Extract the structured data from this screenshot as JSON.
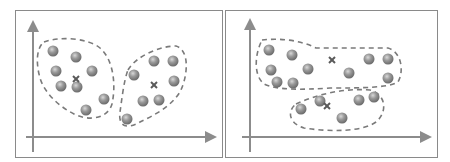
{
  "colors": {
    "frame": "#8a8a8a",
    "axis": "#8c8c8c",
    "dash": "#7a7a7a",
    "point_light": "#d0d0d0",
    "point_mid": "#9a9a9a",
    "point_dark": "#6e6e6e",
    "centroid": "#5a5a5a"
  },
  "panels": [
    {
      "name": "left-panel",
      "frame": {
        "x": 15,
        "y": 10,
        "w": 207,
        "h": 147
      },
      "y_axis": {
        "x": 33,
        "y1": 152,
        "y2": 26
      },
      "x_axis": {
        "y": 137,
        "x1": 26,
        "x2": 211
      },
      "clusters": [
        {
          "name": "cluster-1",
          "outline": "M 44 42 C 60 36, 88 38, 100 48 C 114 60, 116 86, 112 104 C 108 118, 90 122, 74 114 C 58 106, 44 92, 40 78 C 36 64, 36 48, 44 42 Z",
          "points": [
            [
              53,
              51
            ],
            [
              76,
              57
            ],
            [
              56,
              71
            ],
            [
              92,
              71
            ],
            [
              61,
              86
            ],
            [
              77,
              87
            ],
            [
              104,
              99
            ],
            [
              86,
              110
            ]
          ],
          "centroid": [
            76,
            79
          ]
        },
        {
          "name": "cluster-2",
          "outline": "M 128 70 C 136 56, 160 46, 176 46 C 190 50, 188 76, 180 92 C 170 108, 152 116, 140 122 C 126 130, 118 126, 120 112 C 122 98, 124 80, 128 70 Z",
          "points": [
            [
              154,
              61
            ],
            [
              173,
              61
            ],
            [
              134,
              75
            ],
            [
              174,
              81
            ],
            [
              143,
              101
            ],
            [
              159,
              100
            ],
            [
              127,
              119
            ]
          ],
          "centroid": [
            154,
            85
          ]
        }
      ]
    },
    {
      "name": "right-panel",
      "frame": {
        "x": 225,
        "y": 10,
        "w": 212,
        "h": 147
      },
      "y_axis": {
        "x": 250,
        "y1": 152,
        "y2": 24
      },
      "x_axis": {
        "y": 137,
        "x1": 242,
        "x2": 426
      },
      "clusters": [
        {
          "name": "cluster-top",
          "outline": "M 262 40 C 280 38, 300 40, 316 48 L 388 48 C 402 52, 404 72, 398 82 C 388 88, 360 88, 330 88 C 300 90, 276 90, 264 84 C 254 76, 254 56, 262 40 Z",
          "points": [
            [
              269,
              50
            ],
            [
              292,
              55
            ],
            [
              271,
              70
            ],
            [
              308,
              69
            ],
            [
              277,
              82
            ],
            [
              293,
              83
            ],
            [
              349,
              73
            ],
            [
              369,
              59
            ],
            [
              388,
              59
            ],
            [
              388,
              78
            ]
          ],
          "centroid": [
            332,
            60
          ]
        },
        {
          "name": "cluster-bottom",
          "outline": "M 296 104 C 318 94, 344 88, 370 90 C 386 94, 388 112, 376 122 C 362 132, 330 132, 304 128 C 290 124, 286 112, 296 104 Z",
          "points": [
            [
              301,
              109
            ],
            [
              320,
              101
            ],
            [
              359,
              100
            ],
            [
              374,
              97
            ],
            [
              342,
              118
            ]
          ],
          "centroid": [
            327,
            106
          ]
        }
      ]
    }
  ]
}
